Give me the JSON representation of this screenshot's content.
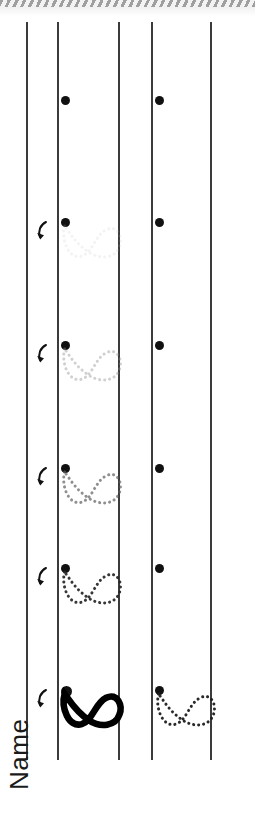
{
  "worksheet": {
    "title": "Infinity Loop Tracing Practice",
    "name_label": "Name",
    "orientation": "landscape-rotated-90",
    "page_color": "#ffffff",
    "rule_color": "#3b3b3b",
    "ink_color": "#111111",
    "scan_edge_label": "scanned-page-edge"
  },
  "columns": [
    {
      "id": "name-column",
      "label": "name-field-column",
      "x": 0,
      "width": 26
    },
    {
      "id": "trace-column",
      "label": "guided-tracing-column",
      "x": 57,
      "width": 61
    },
    {
      "id": "gap-column",
      "label": "spacer-column",
      "x": 118,
      "width": 33
    },
    {
      "id": "practice-column",
      "label": "independent-practice-column",
      "x": 151,
      "width": 59
    },
    {
      "id": "margin-column",
      "label": "right-margin-column",
      "x": 210,
      "width": 45
    }
  ],
  "rule_lines": [
    {
      "id": "line-1",
      "x": 26,
      "top": 22,
      "height": 738
    },
    {
      "id": "line-2",
      "x": 57,
      "top": 22,
      "height": 738
    },
    {
      "id": "line-3",
      "x": 118,
      "top": 22,
      "height": 738
    },
    {
      "id": "line-4",
      "x": 151,
      "top": 22,
      "height": 738
    },
    {
      "id": "line-5",
      "x": 210,
      "top": 22,
      "height": 738
    }
  ],
  "rows": [
    {
      "index": 1,
      "label": "row-1-dot-only",
      "dot_y": 100,
      "guide": {
        "present": false,
        "opacity": 0,
        "style": "none",
        "shade": "none"
      },
      "arrow": false,
      "practice_dot": true,
      "practice_guide": false
    },
    {
      "index": 2,
      "label": "row-2-faintest-trace",
      "dot_y": 222,
      "guide": {
        "present": true,
        "opacity": 0.18,
        "style": "dotted",
        "shade": "#bfbfbf"
      },
      "arrow": true,
      "practice_dot": true,
      "practice_guide": false
    },
    {
      "index": 3,
      "label": "row-3-light-trace",
      "dot_y": 345,
      "guide": {
        "present": true,
        "opacity": 0.42,
        "style": "dotted",
        "shade": "#8f8f8f"
      },
      "arrow": true,
      "practice_dot": true,
      "practice_guide": false
    },
    {
      "index": 4,
      "label": "row-4-medium-trace",
      "dot_y": 468,
      "guide": {
        "present": true,
        "opacity": 0.68,
        "style": "dotted",
        "shade": "#5a5a5a"
      },
      "arrow": true,
      "practice_dot": true,
      "practice_guide": false
    },
    {
      "index": 5,
      "label": "row-5-dark-trace",
      "dot_y": 568,
      "guide": {
        "present": true,
        "opacity": 0.92,
        "style": "dotted",
        "shade": "#262626"
      },
      "arrow": true,
      "practice_dot": true,
      "practice_guide": false
    },
    {
      "index": 6,
      "label": "row-6-solid-model",
      "dot_y": 690,
      "guide": {
        "present": true,
        "opacity": 1,
        "style": "solid-bold",
        "shade": "#000000"
      },
      "arrow": true,
      "practice_dot": true,
      "practice_guide": true
    }
  ],
  "icons": {
    "start_dot": "filled-circle-start-point",
    "direction_arrow": "curved-stroke-direction-arrow",
    "loop_glyph": "infinity-loop-figure-eight"
  }
}
